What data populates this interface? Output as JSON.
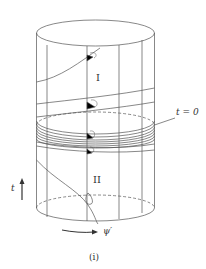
{
  "figure": {
    "caption": "(i)",
    "regions": {
      "upper": "I",
      "lower": "II"
    },
    "labels": {
      "time_slice": "t = 0",
      "time_axis": "t",
      "angle_axis": "ψ′"
    },
    "colors": {
      "stroke": "#555555",
      "fill": "#000000",
      "background": "#ffffff"
    }
  }
}
